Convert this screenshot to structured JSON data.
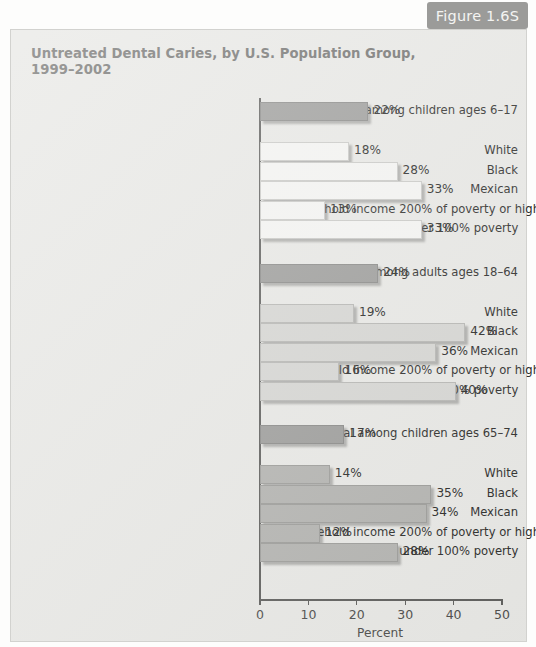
{
  "figure_badge": {
    "label": "Figure 1.6S",
    "bg_color": "#9b9b99",
    "text_color": "#f4f4f2"
  },
  "panel": {
    "bg_color": "#e7e7e4",
    "border_color": "#d2d2cf"
  },
  "chart_data": {
    "type": "bar",
    "orientation": "horizontal",
    "title": "Untreated Dental Caries, by U.S. Population Group,\n1999–2002",
    "xlabel": "Percent",
    "ylabel": "",
    "xlim": [
      0,
      50
    ],
    "xticks": [
      0,
      10,
      20,
      30,
      40,
      50
    ],
    "xticklabels": [
      "0",
      "10",
      "20",
      "30",
      "40",
      "50"
    ],
    "grid": false,
    "legend": "none",
    "value_label_suffix": "%",
    "groups": [
      {
        "name": "children-6-17",
        "total": {
          "label": "Total among children ages 6–17",
          "value": 22,
          "value_label": "22%",
          "style": "total"
        },
        "subgroups": [
          {
            "label": "White",
            "value": 18,
            "value_label": "18%",
            "style": "sub-a"
          },
          {
            "label": "Black",
            "value": 28,
            "value_label": "28%",
            "style": "sub-a"
          },
          {
            "label": "Mexican",
            "value": 33,
            "value_label": "33%",
            "style": "sub-a"
          },
          {
            "label": "Household income 200% of poverty or higher",
            "value": 13,
            "value_label": "13%",
            "style": "sub-a"
          },
          {
            "label": "Household income under 100% poverty",
            "value": 33,
            "value_label": "33%",
            "style": "sub-a"
          }
        ]
      },
      {
        "name": "adults-18-64",
        "total": {
          "label": "Total among adults ages 18–64",
          "value": 24,
          "value_label": "24%",
          "style": "total"
        },
        "subgroups": [
          {
            "label": "White",
            "value": 19,
            "value_label": "19%",
            "style": "sub-b"
          },
          {
            "label": "Black",
            "value": 42,
            "value_label": "42%",
            "style": "sub-b"
          },
          {
            "label": "Mexican",
            "value": 36,
            "value_label": "36%",
            "style": "sub-b"
          },
          {
            "label": "Household income 200% of poverty or higher",
            "value": 16,
            "value_label": "16%",
            "style": "sub-b"
          },
          {
            "label": "Household income under 100% poverty",
            "value": 40,
            "value_label": "40%",
            "style": "sub-b"
          }
        ]
      },
      {
        "name": "ages-65-74",
        "total": {
          "label": "Total among children ages 65–74",
          "value": 17,
          "value_label": "17%",
          "style": "total"
        },
        "subgroups": [
          {
            "label": "White",
            "value": 14,
            "value_label": "14%",
            "style": "sub-c"
          },
          {
            "label": "Black",
            "value": 35,
            "value_label": "35%",
            "style": "sub-c"
          },
          {
            "label": "Mexican",
            "value": 34,
            "value_label": "34%",
            "style": "sub-c"
          },
          {
            "label": "Household income 200% of poverty or higher",
            "value": 12,
            "value_label": "12%",
            "style": "sub-c"
          },
          {
            "label": "Household income under 100% poverty",
            "value": 28,
            "value_label": "28%",
            "style": "sub-c"
          }
        ]
      }
    ]
  }
}
